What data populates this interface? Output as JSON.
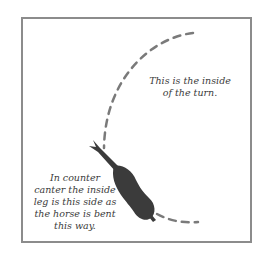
{
  "diagram": {
    "colors": {
      "frame": "#8c8c8c",
      "path": "#7a7a7a",
      "horse": "#3b3b3b",
      "text": "#3a3a3a"
    },
    "labels": {
      "inside_of_turn": {
        "lines": [
          "This is the inside",
          "of the turn."
        ]
      },
      "counter_canter": {
        "lines": [
          "In counter",
          "canter the inside",
          "leg is this side as",
          "the horse is bent",
          "this way."
        ]
      }
    },
    "elements": {
      "path": "dashed-curved-track",
      "horse": "horse-top-view-silhouette"
    }
  }
}
